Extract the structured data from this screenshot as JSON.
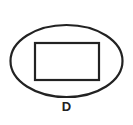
{
  "diagram": {
    "shapes": [
      {
        "type": "ellipse",
        "name": "outer-ellipse"
      },
      {
        "type": "rectangle",
        "name": "inner-rectangle"
      }
    ],
    "label": "D",
    "colors": {
      "stroke": "#222222",
      "background": "#ffffff"
    }
  }
}
